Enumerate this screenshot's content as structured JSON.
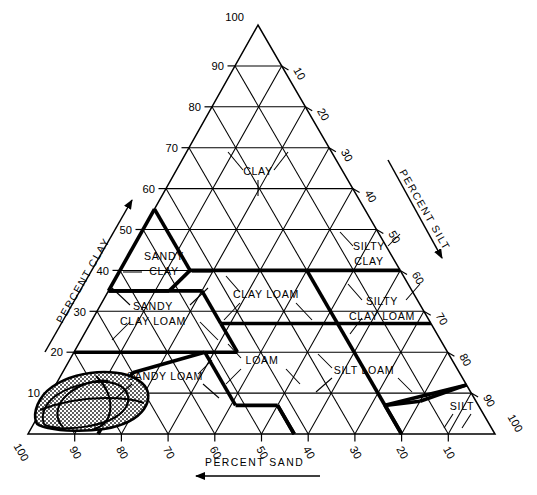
{
  "figure": {
    "type": "ternary-diagram"
  },
  "axes": {
    "left": {
      "name": "PERCENT CLAY",
      "arrow": "up-right",
      "ticks": [
        "10",
        "20",
        "30",
        "40",
        "50",
        "60",
        "70",
        "80",
        "90",
        "100"
      ]
    },
    "right": {
      "name": "PERCENT SILT",
      "arrow": "down-right",
      "ticks": [
        "10",
        "20",
        "30",
        "40",
        "50",
        "60",
        "70",
        "80",
        "90",
        "100"
      ]
    },
    "bottom": {
      "name": "PERCENT SAND",
      "arrow": "left",
      "ticks": [
        "100",
        "90",
        "80",
        "70",
        "60",
        "50",
        "40",
        "30",
        "20",
        "10"
      ]
    },
    "apex_label": "100",
    "left_corner_label": "100",
    "right_corner_label": "100"
  },
  "classes": [
    {
      "id": "clay",
      "label": "CLAY",
      "line2": ""
    },
    {
      "id": "sandy-clay",
      "label": "SANDY",
      "line2": "CLAY"
    },
    {
      "id": "silty-clay",
      "label": "SILTY",
      "line2": "CLAY"
    },
    {
      "id": "sandy-clay-loam",
      "label": "SANDY",
      "line2": "CLAY LOAM"
    },
    {
      "id": "clay-loam",
      "label": "CLAY LOAM",
      "line2": ""
    },
    {
      "id": "silty-clay-loam",
      "label": "SILTY",
      "line2": "CLAY LOAM"
    },
    {
      "id": "sandy-loam",
      "label": "SANDY LOAM",
      "line2": ""
    },
    {
      "id": "loam",
      "label": "LOAM",
      "line2": ""
    },
    {
      "id": "silt-loam",
      "label": "SILT LOAM",
      "line2": ""
    },
    {
      "id": "silt",
      "label": "SILT",
      "line2": ""
    }
  ],
  "chart_data": {
    "type": "ternary",
    "components": [
      "PERCENT SAND",
      "PERCENT SILT",
      "PERCENT CLAY"
    ],
    "axis_range": [
      0,
      100
    ],
    "tick_step": 10,
    "grid": true,
    "legend": "none",
    "classes": [
      {
        "name": "CLAY",
        "clay": [
          40,
          100
        ],
        "note": "apex region above 40% clay"
      },
      {
        "name": "SANDY CLAY",
        "clay": [
          35,
          55
        ],
        "sand": [
          45,
          65
        ]
      },
      {
        "name": "SILTY CLAY",
        "clay": [
          40,
          60
        ],
        "silt": [
          40,
          60
        ]
      },
      {
        "name": "SANDY CLAY LOAM",
        "clay": [
          20,
          35
        ],
        "sand": [
          45,
          80
        ]
      },
      {
        "name": "CLAY LOAM",
        "clay": [
          27,
          40
        ],
        "sand": [
          20,
          45
        ]
      },
      {
        "name": "SILTY CLAY LOAM",
        "clay": [
          27,
          40
        ],
        "silt": [
          40,
          73
        ]
      },
      {
        "name": "SANDY LOAM",
        "clay": [
          0,
          20
        ],
        "sand": [
          43,
          85
        ]
      },
      {
        "name": "LOAM",
        "clay": [
          7,
          27
        ],
        "sand": [
          23,
          52
        ]
      },
      {
        "name": "SILT LOAM",
        "clay": [
          0,
          27
        ],
        "silt": [
          50,
          88
        ]
      },
      {
        "name": "SILT",
        "clay": [
          0,
          12
        ],
        "silt": [
          80,
          100
        ]
      }
    ],
    "annotations": [
      {
        "kind": "shaded-region",
        "label": "",
        "description": "stippled data envelope in sand / loamy-sand corner, sand 70-100%, clay 0-14%"
      }
    ]
  }
}
